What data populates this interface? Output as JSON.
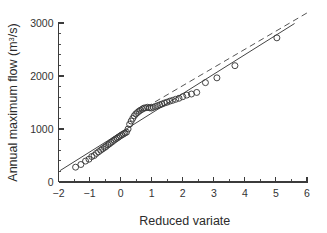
{
  "chart_data": {
    "type": "scatter",
    "title": "",
    "xlabel": "Reduced variate",
    "ylabel": "Annual maximum flow (m³/s)",
    "ylabel_parts": {
      "main": "Annual maximum flow (m",
      "superscript": "3",
      "tail": "/s)"
    },
    "xlim": [
      -2,
      6
    ],
    "ylim": [
      0,
      3000
    ],
    "grid": false,
    "legend": null,
    "xticks": [
      -2,
      -1,
      0,
      1,
      2,
      3,
      4,
      5,
      6
    ],
    "xtick_labels": [
      "−2",
      "−1",
      "0",
      "1",
      "2",
      "3",
      "4",
      "5",
      "6"
    ],
    "xtick_minor_step": 0.5,
    "yticks": [
      0,
      1000,
      2000,
      3000
    ],
    "ytick_labels": [
      "0",
      "1000",
      "2000",
      "3000"
    ],
    "ytick_minor_step": 200,
    "marker": "open-circle",
    "marker_size": 4.0,
    "series": [
      {
        "name": "Annual maximum flow observations",
        "x": [
          -1.45,
          -1.28,
          -1.13,
          -1.02,
          -0.93,
          -0.85,
          -0.78,
          -0.71,
          -0.64,
          -0.58,
          -0.52,
          -0.47,
          -0.41,
          -0.36,
          -0.31,
          -0.26,
          -0.21,
          -0.16,
          -0.11,
          -0.06,
          -0.01,
          0.04,
          0.09,
          0.14,
          0.19,
          0.24,
          0.29,
          0.34,
          0.39,
          0.44,
          0.49,
          0.54,
          0.59,
          0.64,
          0.7,
          0.75,
          0.81,
          0.87,
          0.93,
          0.99,
          1.05,
          1.12,
          1.19,
          1.26,
          1.33,
          1.41,
          1.49,
          1.58,
          1.67,
          1.77,
          1.88,
          2.0,
          2.13,
          2.28,
          2.45,
          2.73,
          3.1,
          3.68,
          5.03
        ],
        "y": [
          280,
          330,
          395,
          430,
          480,
          500,
          540,
          570,
          600,
          625,
          650,
          670,
          700,
          720,
          745,
          765,
          790,
          810,
          830,
          850,
          870,
          890,
          905,
          925,
          940,
          1000,
          1090,
          1150,
          1200,
          1250,
          1285,
          1310,
          1335,
          1355,
          1375,
          1395,
          1400,
          1410,
          1400,
          1395,
          1410,
          1425,
          1440,
          1455,
          1470,
          1490,
          1505,
          1525,
          1540,
          1560,
          1580,
          1610,
          1640,
          1660,
          1690,
          1875,
          1965,
          2195,
          2720
        ]
      }
    ],
    "fit_line": {
      "name": "Fitted Gumbel line",
      "style": "solid",
      "x": [
        -1.95,
        5.6
      ],
      "y": [
        215,
        2990
      ]
    },
    "reference_line": {
      "name": "Reference line",
      "style": "dashed",
      "x": [
        0.55,
        6.0
      ],
      "y": [
        1320,
        3190
      ]
    }
  }
}
